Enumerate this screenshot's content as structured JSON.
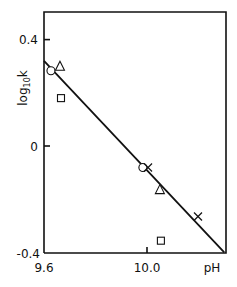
{
  "chart_data": {
    "type": "scatter",
    "title": "",
    "xlabel": "pH",
    "ylabel": "log10k",
    "xlim": [
      9.6,
      10.33
    ],
    "ylim": [
      -0.4,
      0.5
    ],
    "xticks": [
      {
        "value": 9.6,
        "label": "9.6"
      },
      {
        "value": 10.0,
        "label": "10.0"
      }
    ],
    "yticks": [
      {
        "value": 0.4,
        "label": "0.4"
      },
      {
        "value": 0,
        "label": "0"
      },
      {
        "value": -0.4,
        "label": "-0.4"
      }
    ],
    "grid": false,
    "legend": null,
    "series": [
      {
        "name": "circle",
        "marker": "circle",
        "points": [
          [
            9.627,
            0.283
          ],
          [
            9.984,
            -0.081
          ]
        ]
      },
      {
        "name": "triangle",
        "marker": "triangle",
        "points": [
          [
            9.662,
            0.3
          ],
          [
            10.05,
            -0.164
          ]
        ]
      },
      {
        "name": "square",
        "marker": "square",
        "points": [
          [
            9.666,
            0.18
          ],
          [
            10.054,
            -0.356
          ]
        ]
      },
      {
        "name": "cross",
        "marker": "cross",
        "points": [
          [
            10.004,
            -0.081
          ],
          [
            10.198,
            -0.265
          ]
        ]
      }
    ],
    "fit_line": {
      "from": [
        9.6,
        0.32
      ],
      "to": [
        10.3,
        -0.4
      ]
    }
  },
  "labels": {
    "xlabel": "pH",
    "ylabel_main": "log",
    "ylabel_sub": "10",
    "ylabel_end": "k",
    "xtick_0": "9.6",
    "xtick_1": "10.0",
    "ytick_0": "0.4",
    "ytick_1": "0",
    "ytick_2": "-0.4"
  }
}
